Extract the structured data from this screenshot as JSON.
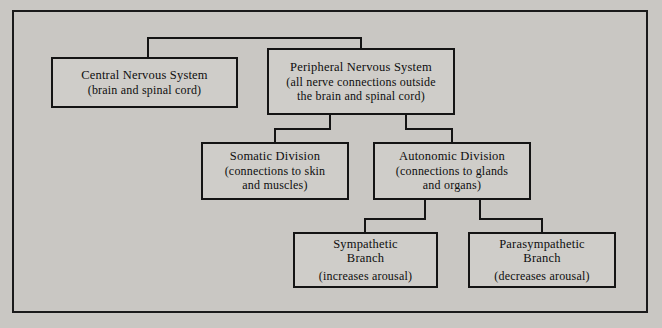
{
  "diagram": {
    "type": "hierarchy-tree",
    "orientation": "top-down",
    "background_color": "#c9c7c3",
    "node_fill_color": "#cfcdc9",
    "border_color": "#141414",
    "text_color": "#0e0e0e",
    "nodes": [
      {
        "id": "central-nervous-system",
        "title": "Central Nervous System",
        "subtitle_lines": [
          "(brain and spinal cord)"
        ]
      },
      {
        "id": "peripheral-nervous-system",
        "title": "Peripheral Nervous System",
        "subtitle_lines": [
          "(all nerve connections outside",
          "the brain and spinal cord)"
        ]
      },
      {
        "id": "somatic-division",
        "title": "Somatic Division",
        "subtitle_lines": [
          "(connections to skin",
          "and muscles)"
        ]
      },
      {
        "id": "autonomic-division",
        "title": "Autonomic Division",
        "subtitle_lines": [
          "(connections to glands",
          "and organs)"
        ]
      },
      {
        "id": "sympathetic-branch",
        "title": "Sympathetic",
        "title_line2": "Branch",
        "subtitle_lines": [
          "(increases arousal)"
        ]
      },
      {
        "id": "parasympathetic-branch",
        "title": "Parasympathetic",
        "title_line2": "Branch",
        "subtitle_lines": [
          "(decreases arousal)"
        ]
      }
    ],
    "edges": [
      {
        "from": "root",
        "to": "central-nervous-system"
      },
      {
        "from": "root",
        "to": "peripheral-nervous-system"
      },
      {
        "from": "peripheral-nervous-system",
        "to": "somatic-division"
      },
      {
        "from": "peripheral-nervous-system",
        "to": "autonomic-division"
      },
      {
        "from": "autonomic-division",
        "to": "sympathetic-branch"
      },
      {
        "from": "autonomic-division",
        "to": "parasympathetic-branch"
      }
    ]
  }
}
